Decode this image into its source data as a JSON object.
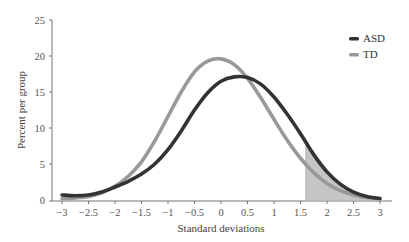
{
  "chart_data": {
    "type": "line",
    "title": "",
    "xlabel": "Standard deviations",
    "ylabel": "Percent per group",
    "xlim": [
      -3,
      3
    ],
    "ylim": [
      0,
      25
    ],
    "x_ticks": [
      -3,
      -2.5,
      -2,
      -1.5,
      -1,
      -0.5,
      0,
      0.5,
      1,
      1.5,
      2,
      2.5,
      3
    ],
    "x_tick_labels": [
      "−3",
      "−2.5",
      "−2",
      "−1.5",
      "−1",
      "−0.5",
      "0",
      "0.5",
      "1",
      "1.5",
      "2",
      "2.5",
      "3"
    ],
    "y_ticks": [
      0,
      5,
      10,
      15,
      20,
      25
    ],
    "y_tick_labels": [
      "0",
      "5",
      "10",
      "15",
      "20",
      "25"
    ],
    "grid": false,
    "legend_position": "upper right",
    "x": [
      -3,
      -2.75,
      -2.5,
      -2.25,
      -2,
      -1.75,
      -1.5,
      -1.25,
      -1,
      -0.75,
      -0.5,
      -0.25,
      0,
      0.25,
      0.5,
      0.75,
      1,
      1.25,
      1.5,
      1.75,
      2,
      2.25,
      2.5,
      2.75,
      3
    ],
    "series": [
      {
        "name": "ASD",
        "color": "#333333",
        "values": [
          0.7,
          0.6,
          0.7,
          1.1,
          1.8,
          2.6,
          3.6,
          5.0,
          7.0,
          9.6,
          12.5,
          14.9,
          16.5,
          17.1,
          17.0,
          16.1,
          14.3,
          11.9,
          9.2,
          6.3,
          3.9,
          2.2,
          1.1,
          0.5,
          0.2
        ]
      },
      {
        "name": "TD",
        "color": "#999999",
        "values": [
          0.2,
          0.3,
          0.5,
          1.0,
          1.9,
          3.3,
          5.3,
          8.2,
          11.6,
          15.0,
          17.8,
          19.3,
          19.6,
          18.8,
          16.9,
          14.2,
          11.2,
          8.3,
          5.8,
          3.8,
          2.3,
          1.3,
          0.7,
          0.35,
          0.2
        ]
      }
    ],
    "annotations": [
      {
        "type": "shaded_region",
        "x_from": 1.6,
        "x_to": 3,
        "under_series": "ASD",
        "color": "#bbbbbb",
        "description": "Shaded tail area under ASD curve beyond 1.6 SD"
      }
    ]
  },
  "legend": {
    "items": [
      {
        "label": "ASD",
        "color": "#333333"
      },
      {
        "label": "TD",
        "color": "#999999"
      }
    ]
  },
  "axes": {
    "x_title": "Standard deviations",
    "y_title": "Percent per group"
  }
}
